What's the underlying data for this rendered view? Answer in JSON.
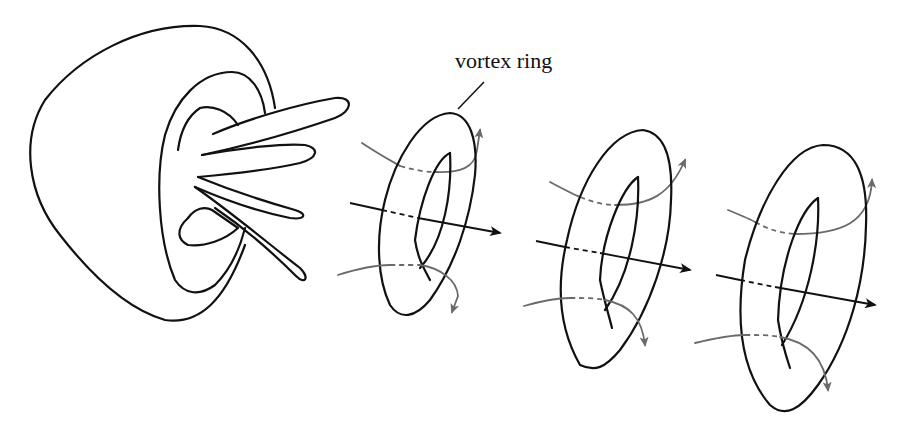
{
  "diagram": {
    "title": "",
    "labels": {
      "vortex_ring": "vortex ring"
    },
    "components": [
      {
        "id": "jellyfish-bell",
        "description": "bell-shaped body with inner rim and tentacle-like jets"
      },
      {
        "id": "vortex-ring-1",
        "description": "first vortex ring with flow axis arrow and circulation arrows"
      },
      {
        "id": "vortex-ring-2",
        "description": "second vortex ring with flow axis arrow and circulation arrows"
      },
      {
        "id": "vortex-ring-3",
        "description": "third vortex ring with flow axis arrow and circulation arrows"
      }
    ],
    "colors": {
      "ink": "#111111",
      "flow": "#6a6a6a",
      "background": "#ffffff"
    }
  }
}
